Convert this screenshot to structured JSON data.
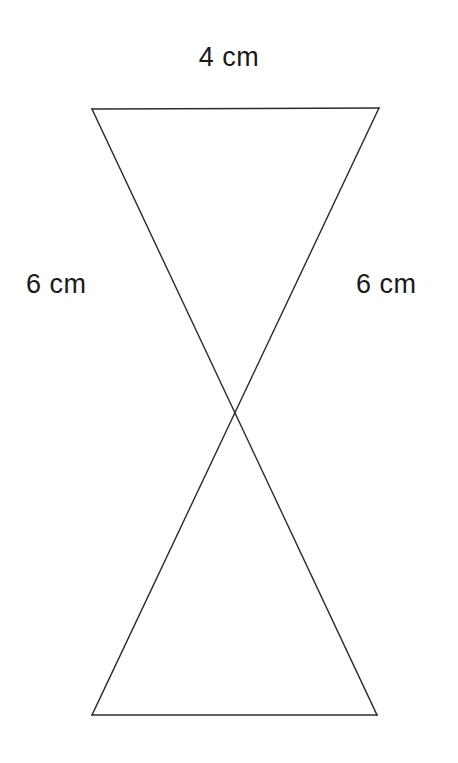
{
  "figure": {
    "background_color": "#ffffff",
    "stroke_color": "#2b2b2b",
    "text_color": "#1a1a1a",
    "stroke_width": 1.4,
    "labels": {
      "top": "4 cm",
      "left": "6 cm",
      "right": "6 cm"
    },
    "geometry": {
      "top_left": [
        92,
        109
      ],
      "top_right": [
        379,
        108
      ],
      "bottom_left": [
        92,
        715
      ],
      "bottom_right": [
        377,
        715
      ],
      "crossing_point": [
        233,
        412
      ],
      "segments": [
        {
          "name": "top-edge",
          "from": [
            92,
            109
          ],
          "to": [
            379,
            108
          ]
        },
        {
          "name": "bottom-edge",
          "from": [
            92,
            715
          ],
          "to": [
            377,
            715
          ]
        },
        {
          "name": "diagonal-topleft-to-bottomright",
          "from": [
            92,
            109
          ],
          "to": [
            377,
            715
          ]
        },
        {
          "name": "diagonal-topright-to-bottomleft",
          "from": [
            379,
            108
          ],
          "to": [
            92,
            715
          ]
        }
      ]
    }
  },
  "chart_data": {
    "type": "diagram",
    "title": "",
    "shape": "bowtie",
    "measurements": [
      {
        "edge": "top",
        "label": "4 cm",
        "value": 4,
        "unit": "cm"
      },
      {
        "edge": "left",
        "label": "6 cm",
        "value": 6,
        "unit": "cm"
      },
      {
        "edge": "right",
        "label": "6 cm",
        "value": 6,
        "unit": "cm"
      }
    ]
  }
}
